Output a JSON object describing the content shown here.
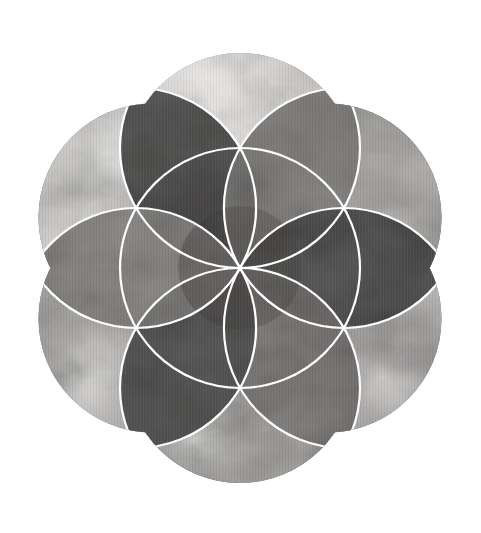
{
  "artwork": {
    "title": "Seed of Life",
    "subject": "sacred-geometry-rosette",
    "medium": "watercolor wash, grayscale",
    "background_color": "#ffffff",
    "line_color": "#ffffff",
    "line_width_px": 2.2,
    "caption": "",
    "canvas": {
      "width": 481,
      "height": 533
    },
    "composition": {
      "center_x": 240,
      "center_y": 268,
      "outer_lobe_count": 6,
      "outer_lobe_radius": 114,
      "outer_lobe_center_distance": 101,
      "inner_circle_count": 6,
      "inner_circle_radius": 120,
      "inner_circle_center_distance": 120,
      "rosette_petal_count": 6,
      "bounding_box": {
        "left": 25,
        "top": 33,
        "right": 455,
        "bottom": 505
      }
    },
    "palette": {
      "lightest": "#f2f0ee",
      "light": "#d8d5d2",
      "mid_light": "#b9b6b3",
      "mid": "#9a9795",
      "mid_dark": "#7b7876",
      "dark": "#5a5755",
      "darkest": "#3a3836",
      "ink": "#242221"
    },
    "outer_lobes": [
      {
        "name": "lobe-top",
        "angle_deg": -90,
        "tone": "#8f8c89",
        "tone2": "#5d5a58",
        "opacity": 0.95
      },
      {
        "name": "lobe-upper-right",
        "angle_deg": -30,
        "tone": "#4d4b49",
        "tone2": "#2e2c2b",
        "opacity": 0.95
      },
      {
        "name": "lobe-lower-right",
        "angle_deg": 30,
        "tone": "#8c8986",
        "tone2": "#5e5b59",
        "opacity": 0.95
      },
      {
        "name": "lobe-bottom",
        "angle_deg": 90,
        "tone": "#6f6c6a",
        "tone2": "#444240",
        "opacity": 0.95
      },
      {
        "name": "lobe-lower-left",
        "angle_deg": 150,
        "tone": "#9b9895",
        "tone2": "#6b6866",
        "opacity": 0.95
      },
      {
        "name": "lobe-upper-left",
        "angle_deg": -150,
        "tone": "#55524f",
        "tone2": "#33312f",
        "opacity": 0.95
      }
    ],
    "inner_circles": [
      {
        "name": "inner-circle-top",
        "angle_deg": -90,
        "tone": "#dedbd8"
      },
      {
        "name": "inner-circle-upper-right",
        "angle_deg": -30,
        "tone": "#cfcdca"
      },
      {
        "name": "inner-circle-lower-right",
        "angle_deg": 30,
        "tone": "#d5d2cf"
      },
      {
        "name": "inner-circle-bottom",
        "angle_deg": 90,
        "tone": "#c9c6c3"
      },
      {
        "name": "inner-circle-lower-left",
        "angle_deg": 150,
        "tone": "#d2cfcc"
      },
      {
        "name": "inner-circle-upper-left",
        "angle_deg": -150,
        "tone": "#dcd9d6"
      }
    ],
    "rosette_petals": [
      {
        "name": "petal-n",
        "angle_deg": -90,
        "tone": "#6e6b69"
      },
      {
        "name": "petal-ne",
        "angle_deg": -30,
        "tone": "#2f2d2c"
      },
      {
        "name": "petal-se",
        "angle_deg": 30,
        "tone": "#6a6765"
      },
      {
        "name": "petal-s",
        "angle_deg": 90,
        "tone": "#3d3b3a"
      },
      {
        "name": "petal-sw",
        "angle_deg": 150,
        "tone": "#7a7775"
      },
      {
        "name": "petal-nw",
        "angle_deg": -150,
        "tone": "#2b2928"
      }
    ]
  }
}
